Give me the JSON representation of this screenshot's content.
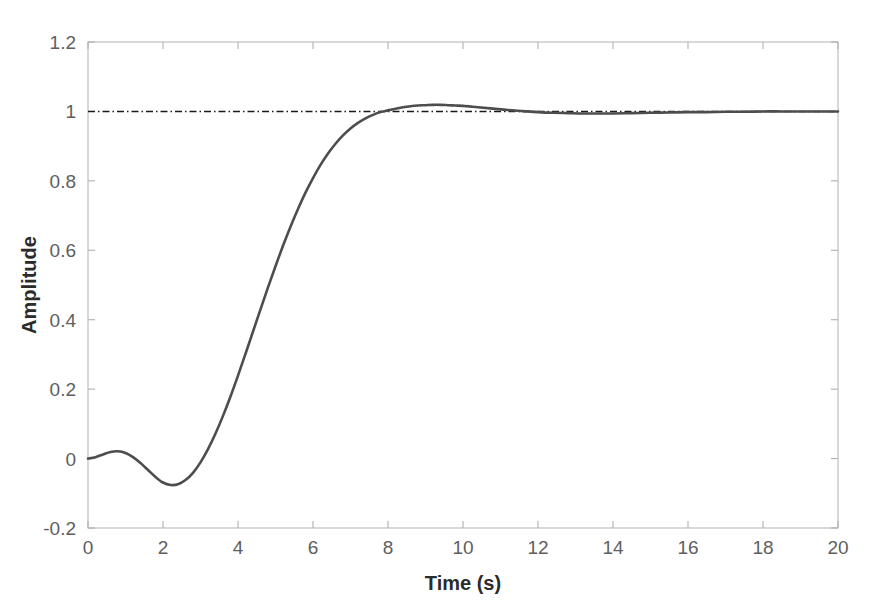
{
  "figure": {
    "background_color": "#ffffff",
    "frame_color": "#b8b8b8",
    "curve_color": "#4d4d4d",
    "reference_color": "#1a1a1a"
  },
  "axes": {
    "x_title": "Time (s)",
    "y_title": "Amplitude",
    "x_tick_labels": [
      "0",
      "2",
      "4",
      "6",
      "8",
      "10",
      "12",
      "14",
      "16",
      "18",
      "20"
    ],
    "y_tick_labels": [
      "-0.2",
      "0",
      "0.2",
      "0.4",
      "0.6",
      "0.8",
      "1",
      "1.2"
    ]
  },
  "chart_data": {
    "type": "line",
    "title": "",
    "subtitle": "",
    "xlabel": "Time (s)",
    "ylabel": "Amplitude",
    "xlim": [
      0,
      20
    ],
    "ylim": [
      -0.2,
      1.2
    ],
    "xticks": [
      0,
      2,
      4,
      6,
      8,
      10,
      12,
      14,
      16,
      18,
      20
    ],
    "yticks": [
      -0.2,
      0,
      0.2,
      0.4,
      0.6,
      0.8,
      1,
      1.2
    ],
    "grid": false,
    "legend": null,
    "legend_position": "none",
    "annotations": [
      {
        "text": "steady-state reference line at Amplitude = 1",
        "type": "hline",
        "y": 1.0,
        "style": "dash-dot",
        "color": "#1a1a1a"
      }
    ],
    "series": [
      {
        "name": "Step response",
        "style": "solid",
        "color": "#4d4d4d",
        "x": [
          0,
          0.2,
          0.4,
          0.6,
          0.8,
          1.0,
          1.2,
          1.4,
          1.6,
          1.8,
          2.0,
          2.2,
          2.4,
          2.6,
          2.8,
          3.0,
          3.2,
          3.4,
          3.6,
          3.8,
          4.0,
          4.2,
          4.4,
          4.6,
          4.8,
          5.0,
          5.2,
          5.4,
          5.6,
          5.8,
          6.0,
          6.2,
          6.4,
          6.6,
          6.8,
          7.0,
          7.2,
          7.4,
          7.6,
          7.8,
          8.0,
          8.2,
          8.4,
          8.6,
          8.8,
          9.0,
          9.2,
          9.4,
          9.6,
          9.8,
          10.0,
          10.4,
          10.8,
          11.2,
          11.6,
          12.0,
          12.4,
          12.8,
          13.2,
          13.6,
          14.0,
          14.5,
          15.0,
          15.5,
          16.0,
          16.5,
          17.0,
          17.5,
          18.0,
          18.5,
          19.0,
          19.5,
          20.0
        ],
        "values": [
          0.0,
          0.004,
          0.012,
          0.019,
          0.021,
          0.016,
          0.004,
          -0.013,
          -0.033,
          -0.053,
          -0.069,
          -0.076,
          -0.074,
          -0.062,
          -0.041,
          -0.011,
          0.027,
          0.072,
          0.123,
          0.179,
          0.239,
          0.302,
          0.366,
          0.43,
          0.493,
          0.554,
          0.613,
          0.668,
          0.719,
          0.766,
          0.808,
          0.846,
          0.879,
          0.907,
          0.931,
          0.951,
          0.967,
          0.98,
          0.99,
          0.998,
          1.003,
          1.008,
          1.012,
          1.015,
          1.017,
          1.018,
          1.019,
          1.019,
          1.018,
          1.017,
          1.016,
          1.012,
          1.008,
          1.004,
          1.001,
          0.998,
          0.996,
          0.995,
          0.994,
          0.994,
          0.994,
          0.995,
          0.996,
          0.997,
          0.998,
          0.998,
          0.999,
          0.999,
          1.0,
          1.0,
          1.0,
          1.0,
          1.0
        ]
      }
    ],
    "reference_series": [
      {
        "name": "Reference",
        "style": "dash-dot",
        "color": "#1a1a1a",
        "x": [
          0,
          20
        ],
        "values": [
          1.0,
          1.0
        ]
      }
    ]
  }
}
